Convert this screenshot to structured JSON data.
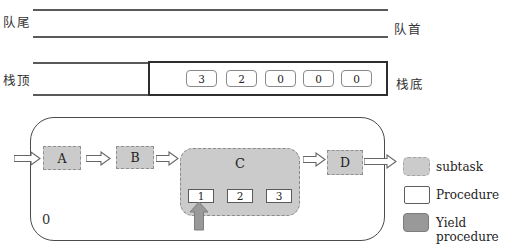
{
  "queue": {
    "tail_label": "队尾",
    "head_label": "队首"
  },
  "stack": {
    "top_label": "栈顶",
    "bottom_label": "栈底",
    "cells": [
      "3",
      "2",
      "0",
      "0",
      "0"
    ]
  },
  "flow": {
    "container_label": "0",
    "node_a": "A",
    "node_b": "B",
    "node_c": "C",
    "node_d": "D",
    "c_subtasks": [
      "1",
      "2",
      "3"
    ]
  },
  "legend": {
    "subtask_label": "subtask",
    "procedure_label": "Procedure",
    "yield_label": "Yield procedure"
  },
  "colors": {
    "subtask_fill": "#cbcbcb",
    "procedure_fill": "#ffffff",
    "yield_fill": "#999999",
    "line": "#5a5a5a"
  }
}
